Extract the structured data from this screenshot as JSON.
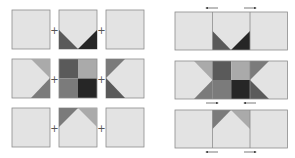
{
  "diagram": {
    "colors": {
      "light": "#e3e3e3",
      "border": "#8c8c8c",
      "medium_light": "#aaaaaa",
      "medium": "#7b7b7b",
      "medium_dark": "#5a5a5a",
      "dark": "#262626",
      "plus": "#555555",
      "arrow": "#444444"
    },
    "left_panel": {
      "label": "Units laid out with plus signs",
      "plus_sign": "+",
      "rows": [
        {
          "units": [
            "plain",
            "flying-geese-down",
            "plain"
          ]
        },
        {
          "units": [
            "flying-geese-right",
            "four-patch",
            "flying-geese-left"
          ]
        },
        {
          "units": [
            "plain",
            "flying-geese-up",
            "plain"
          ]
        }
      ]
    },
    "right_panel": {
      "label": "Units joined into rows, pressing arrows shown",
      "arrows": [
        {
          "row": 1,
          "position": "above",
          "directions": [
            "left",
            "right"
          ]
        },
        {
          "row": 2,
          "position": "below",
          "directions": [
            "right",
            "left"
          ]
        },
        {
          "row": 3,
          "position": "below",
          "directions": [
            "left",
            "right"
          ]
        }
      ]
    }
  }
}
